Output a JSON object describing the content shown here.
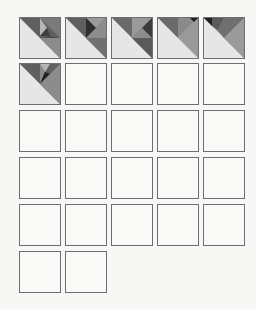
{
  "board": {
    "columns": 5,
    "tile_size": 40,
    "col_x": [
      19,
      65,
      111,
      157,
      203
    ],
    "row_y": [
      17,
      63,
      110,
      157,
      204,
      251
    ],
    "colors": {
      "light": "#e6e6e6",
      "mid": "#8c8c8c",
      "dark": "#5f5f5f",
      "darker": "#3a3a3a",
      "darkest": "#1f1f1f",
      "pale": "#b5b5b5",
      "border": "#6e6e6e",
      "empty": "#f9f9f8"
    },
    "tiles": [
      {
        "index": 0,
        "state": "filled",
        "pattern": "A"
      },
      {
        "index": 1,
        "state": "filled",
        "pattern": "B"
      },
      {
        "index": 2,
        "state": "filled",
        "pattern": "C"
      },
      {
        "index": 3,
        "state": "filled",
        "pattern": "D"
      },
      {
        "index": 4,
        "state": "filled",
        "pattern": "E"
      },
      {
        "index": 5,
        "state": "filled",
        "pattern": "F"
      },
      {
        "index": 6,
        "state": "empty"
      },
      {
        "index": 7,
        "state": "empty"
      },
      {
        "index": 8,
        "state": "empty"
      },
      {
        "index": 9,
        "state": "empty"
      },
      {
        "index": 10,
        "state": "empty"
      },
      {
        "index": 11,
        "state": "empty"
      },
      {
        "index": 12,
        "state": "empty"
      },
      {
        "index": 13,
        "state": "empty"
      },
      {
        "index": 14,
        "state": "empty"
      },
      {
        "index": 15,
        "state": "empty"
      },
      {
        "index": 16,
        "state": "empty"
      },
      {
        "index": 17,
        "state": "empty"
      },
      {
        "index": 18,
        "state": "empty"
      },
      {
        "index": 19,
        "state": "empty"
      },
      {
        "index": 20,
        "state": "empty"
      },
      {
        "index": 21,
        "state": "empty"
      },
      {
        "index": 22,
        "state": "empty"
      },
      {
        "index": 23,
        "state": "empty"
      },
      {
        "index": 24,
        "state": "empty"
      },
      {
        "index": 25,
        "state": "empty"
      },
      {
        "index": 26,
        "state": "empty"
      }
    ]
  }
}
